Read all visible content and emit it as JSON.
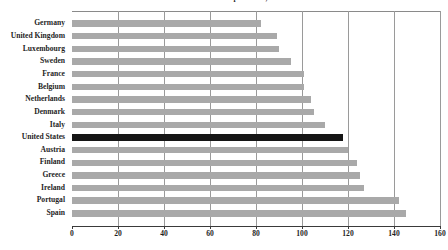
{
  "chart_data": {
    "type": "bar",
    "orientation": "horizontal",
    "title": "Total Health Care Expenditure, 1997",
    "xlabel": "",
    "ylabel": "",
    "xlim": [
      0,
      160
    ],
    "xticks": [
      0,
      20,
      40,
      60,
      80,
      100,
      120,
      140,
      160
    ],
    "grid": "vertical",
    "legend": "none",
    "highlight_category": "United States",
    "colors": {
      "bar": "#a9a9a9",
      "highlight_bar": "#151515",
      "gridline": "#9a9a9a",
      "axis": "#3a3a3a",
      "background": "#ffffff",
      "text": "#1e1e1e"
    },
    "categories": [
      "Germany",
      "United Kingdom",
      "Luxembourg",
      "Sweden",
      "France",
      "Belgium",
      "Netherlands",
      "Denmark",
      "Italy",
      "United States",
      "Austria",
      "Finland",
      "Greece",
      "Ireland",
      "Portugal",
      "Spain"
    ],
    "values": [
      82,
      89,
      90,
      95,
      101,
      101,
      104,
      105,
      110,
      118,
      120,
      124,
      125,
      127,
      142,
      145
    ]
  }
}
